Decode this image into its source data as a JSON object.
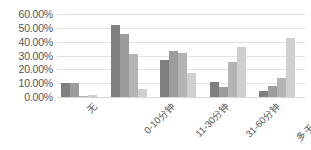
{
  "chart_data": {
    "type": "bar",
    "title": "",
    "subtitle": "",
    "xlabel": "",
    "ylabel": "",
    "ylim": [
      0,
      60
    ],
    "ytick_values": [
      0,
      10,
      20,
      30,
      40,
      50,
      60
    ],
    "ytick_labels": [
      "0.00%",
      "10.00%",
      "20.00%",
      "30.00%",
      "40.00%",
      "50.00%",
      "60.00%"
    ],
    "grid": true,
    "legend": false,
    "legend_position": "none",
    "annotations": [],
    "categories": [
      "无",
      "0-10分钟",
      "11-30分钟",
      "31-60分钟",
      "多于60分钟"
    ],
    "series": [
      {
        "name": "series-1",
        "color": "#7f7f7f",
        "values": [
          10.0,
          52.0,
          27.0,
          11.0,
          4.5
        ]
      },
      {
        "name": "series-2",
        "color": "#9c9c9c",
        "values": [
          10.0,
          45.5,
          33.0,
          7.5,
          8.0
        ]
      },
      {
        "name": "series-3",
        "color": "#b4b4b4",
        "values": [
          0.5,
          31.0,
          31.5,
          25.0,
          14.0
        ]
      },
      {
        "name": "series-4",
        "color": "#cfcfcf",
        "values": [
          1.5,
          5.5,
          17.0,
          36.0,
          42.5
        ]
      }
    ]
  }
}
